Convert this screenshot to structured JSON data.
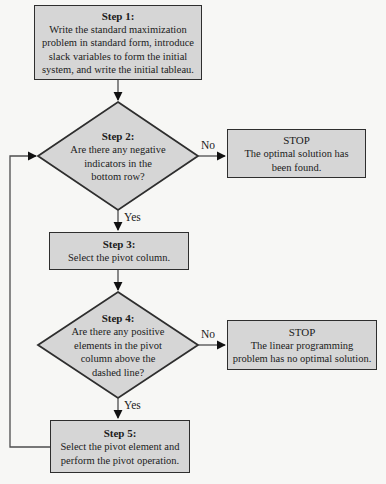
{
  "colors": {
    "background": "#f7f7f5",
    "node_fill": "#d6d6d6",
    "node_border": "#2e2e2e",
    "line": "#4d4d4d",
    "arrowhead": "#111111",
    "text": "#1b1b1b"
  },
  "nodes": {
    "step1": {
      "title": "Step 1:",
      "lines": [
        "Write the standard maximization",
        "problem in standard form, introduce",
        "slack variables to form the initial",
        "system, and write the initial tableau."
      ]
    },
    "step2": {
      "title": "Step 2:",
      "lines": [
        "Are there any negative",
        "indicators in the",
        "bottom row?"
      ]
    },
    "stop_optimal": {
      "title": "STOP",
      "lines": [
        "The optimal solution has",
        "been found."
      ]
    },
    "step3": {
      "title": "Step 3:",
      "lines": [
        "Select the pivot column."
      ]
    },
    "step4": {
      "title": "Step 4:",
      "lines": [
        "Are there any positive",
        "elements in the pivot",
        "column above the",
        "dashed line?"
      ]
    },
    "stop_no_solution": {
      "title": "STOP",
      "lines": [
        "The linear programming",
        "problem has no optimal solution."
      ]
    },
    "step5": {
      "title": "Step 5:",
      "lines": [
        "Select the pivot element and",
        "perform the pivot operation."
      ]
    }
  },
  "edge_labels": {
    "step2_no": "No",
    "step2_yes": "Yes",
    "step4_no": "No",
    "step4_yes": "Yes"
  }
}
